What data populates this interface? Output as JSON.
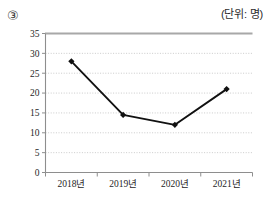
{
  "header": {
    "item_number": "③",
    "unit_label": "(단위: 명)"
  },
  "chart_data": {
    "type": "line",
    "title": "",
    "subtitle": "",
    "xlabel": "",
    "ylabel": "",
    "unit": "명",
    "categories": [
      "2018년",
      "2019년",
      "2020년",
      "2021년"
    ],
    "values": [
      28,
      14.5,
      12,
      21
    ],
    "series": [
      {
        "name": "인원",
        "values": [
          28,
          14.5,
          12,
          21
        ]
      }
    ],
    "ylim": [
      0,
      35
    ],
    "ytick_step": 5,
    "ytick_labels": [
      "0",
      "5",
      "10",
      "15",
      "20",
      "25",
      "30",
      "35"
    ],
    "xtick_labels": [
      "2018년",
      "2019년",
      "2020년",
      "2021년"
    ],
    "grid": "horizontal-dotted",
    "legend": "none",
    "marker": "diamond",
    "line_color": "#111111",
    "marker_color": "#111111",
    "grid_color": "#b4b4b4",
    "axis_color": "#8e8e8e",
    "top_border_color": "#a8a8a8"
  }
}
